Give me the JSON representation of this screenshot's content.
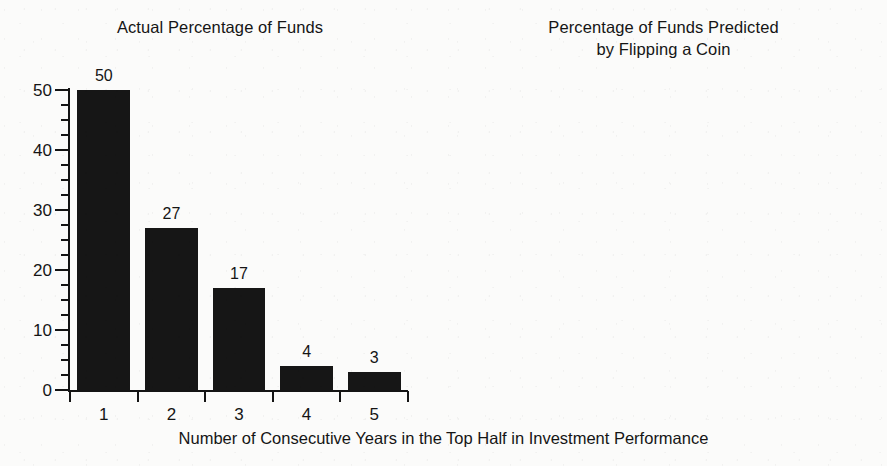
{
  "figure": {
    "background_color": "#fbfbfa",
    "ink_color": "#161616",
    "xaxis_caption": "Number of Consecutive Years in the Top Half in Investment Performance"
  },
  "chart_data": [
    {
      "type": "bar",
      "panel": "left",
      "title": "Actual Percentage of Funds",
      "categories": [
        "1",
        "2",
        "3",
        "4",
        "5"
      ],
      "values": [
        50,
        27,
        17,
        4,
        3
      ],
      "data_labels": [
        "50",
        "27",
        "17",
        "4",
        "3"
      ],
      "xlabel": "Number of Consecutive Years in the Top Half in Investment Performance",
      "ylabel": "",
      "ylim": [
        0,
        50
      ],
      "ytick_labels": [
        "0",
        "10",
        "20",
        "30",
        "40",
        "50"
      ],
      "ytick_values": [
        0,
        10,
        20,
        30,
        40,
        50
      ],
      "yminor_interval": 2.5,
      "grid": false,
      "legend": null,
      "bar_color": "#161616"
    },
    {
      "type": "bar",
      "panel": "right",
      "title": "Percentage of Funds Predicted\nby Flipping a Coin",
      "title_line1": "Percentage of Funds Predicted",
      "title_line2": "by Flipping a Coin",
      "categories": [
        "1",
        "2",
        "3",
        "4",
        "5"
      ],
      "values": [
        50,
        25,
        13,
        6,
        3
      ],
      "data_labels": [
        "50",
        "25",
        "13",
        "6",
        "3"
      ],
      "xlabel": "Number of Consecutive Years in the Top Half in Investment Performance",
      "ylabel": "",
      "ylim": [
        0,
        50
      ],
      "ytick_labels": [
        "0",
        "10",
        "20",
        "30",
        "40",
        "50"
      ],
      "ytick_values": [
        0,
        10,
        20,
        30,
        40,
        50
      ],
      "yminor_interval": 2.5,
      "grid": false,
      "legend": null,
      "bar_color": "#161616"
    }
  ]
}
